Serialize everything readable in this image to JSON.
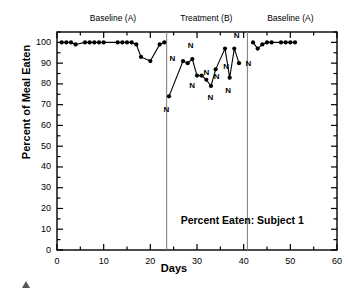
{
  "figure": {
    "annotation": "Percent Eaten: Subject 1",
    "xlabel": "Days",
    "ylabel": "Percent of Meal Eaten",
    "phase_labels": [
      {
        "text": "Baseline (A)",
        "center_day": 12
      },
      {
        "text": "Treatment (B)",
        "center_day": 32
      },
      {
        "text": "Baseline (A)",
        "center_day": 50
      }
    ],
    "marker_color": "#000000",
    "line_color": "#000000",
    "divider_color": "#7a7a7a",
    "axis_color": "#000000"
  },
  "chart_data": {
    "type": "line",
    "title": "Percent Eaten: Subject 1",
    "xlabel": "Days",
    "ylabel": "Percent of Meal Eaten",
    "xlim": [
      0,
      60
    ],
    "ylim": [
      0,
      100
    ],
    "xticks": [
      0,
      10,
      20,
      30,
      40,
      50,
      60
    ],
    "yticks": [
      0,
      10,
      20,
      30,
      40,
      50,
      60,
      70,
      80,
      90,
      100
    ],
    "xminor_step": 5,
    "yminor_step": 5,
    "grid": false,
    "legend": "none",
    "phase_dividers": [
      23.5,
      40.8
    ],
    "series": [
      {
        "name": "Baseline (A) - phase 1",
        "x": [
          1,
          2,
          3,
          4,
          6,
          7,
          8,
          9,
          10,
          13,
          14,
          15,
          16,
          17,
          18,
          20,
          22,
          23
        ],
        "y": [
          100,
          100,
          100,
          99,
          100,
          100,
          100,
          100,
          100,
          100,
          100,
          100,
          100,
          99,
          93,
          91,
          99,
          100
        ]
      },
      {
        "name": "Treatment (B) - phase 2",
        "x": [
          24,
          27,
          28,
          29,
          30,
          31,
          32,
          33,
          34,
          36,
          37,
          38,
          39
        ],
        "y": [
          74,
          91,
          90,
          92,
          84,
          84,
          82,
          79,
          87,
          97,
          83,
          97,
          90
        ]
      },
      {
        "name": "Baseline (A) - phase 3",
        "x": [
          42,
          43,
          44,
          45,
          46,
          48,
          49,
          50,
          51
        ],
        "y": [
          100,
          97,
          99,
          100,
          100,
          100,
          100,
          100,
          100
        ]
      }
    ],
    "point_annotations": [
      {
        "label": "N",
        "x": 24,
        "y": 74
      },
      {
        "label": "N",
        "x": 27,
        "y": 91
      },
      {
        "label": "N",
        "x": 29,
        "y": 92
      },
      {
        "label": "N",
        "x": 30,
        "y": 84
      },
      {
        "label": "N",
        "x": 31,
        "y": 84
      },
      {
        "label": "N",
        "x": 32,
        "y": 82
      },
      {
        "label": "N",
        "x": 33,
        "y": 79
      },
      {
        "label": "N",
        "x": 34,
        "y": 87
      },
      {
        "label": "N",
        "x": 37,
        "y": 83
      },
      {
        "label": "N",
        "x": 38,
        "y": 97
      },
      {
        "label": "N",
        "x": 39,
        "y": 90
      }
    ]
  }
}
